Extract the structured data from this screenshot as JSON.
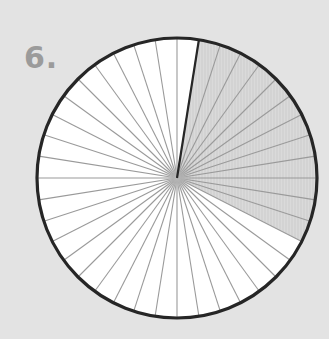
{
  "problem": {
    "number_label": "6."
  },
  "diagram": {
    "type": "fraction-circle",
    "total_segments": 40,
    "shaded_segments": 12,
    "shaded_start_segment": 1,
    "center": [
      177,
      178
    ],
    "radius": 140,
    "colors": {
      "background": "#e3e3e3",
      "unshaded_fill": "#ffffff",
      "shaded_fill": "#dadada",
      "hatch": "#c4c4c4",
      "segment_line": "#9a9a9a",
      "outline": "#262626",
      "start_marker": "#262626"
    }
  }
}
